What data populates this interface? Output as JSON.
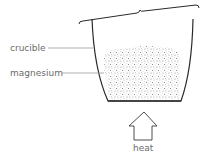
{
  "diagram": {
    "labels": {
      "crucible": "crucible",
      "magnesium": "magnesium",
      "heat": "heat"
    },
    "colors": {
      "outline": "#2a2a2a",
      "leader": "#9a9a9a",
      "text": "#6b6b6b",
      "speckle": "#8a8a8a"
    }
  }
}
